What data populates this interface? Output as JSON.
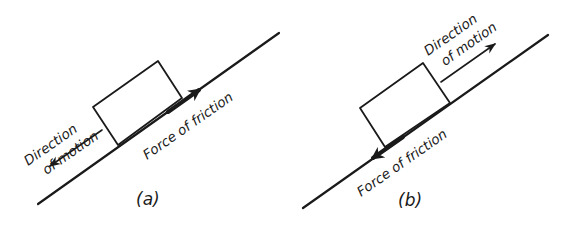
{
  "figure": {
    "panels": [
      {
        "id": "a",
        "label": "(a)",
        "motion_label_line1": "Direction",
        "motion_label_line2": "of motion",
        "friction_label": "Force of friction",
        "motion_direction": "down-slope",
        "friction_direction": "up-slope"
      },
      {
        "id": "b",
        "label": "(b)",
        "motion_label_line1": "Direction",
        "motion_label_line2": "of motion",
        "friction_label": "Force of friction",
        "motion_direction": "up-slope",
        "friction_direction": "down-slope"
      }
    ],
    "colors": {
      "ink": "#1a1a1a",
      "background": "#ffffff"
    }
  }
}
